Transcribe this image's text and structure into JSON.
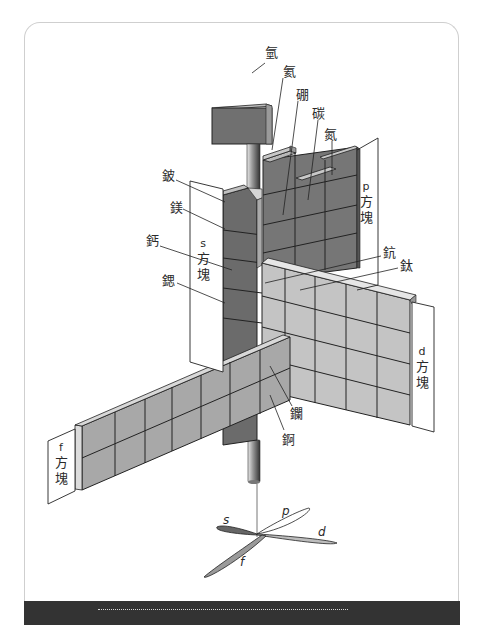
{
  "diagram": {
    "colors": {
      "s_block": "#6b6b6b",
      "p_block": "#767676",
      "d_block": "#c4c4c4",
      "f_block": "#a8a8a8",
      "hydrogen": "#707070",
      "rod": "#8a8a8a",
      "footer": "#333333",
      "card_border": "#cfcfcf"
    },
    "element_labels": {
      "hydrogen": "氫",
      "helium": "氦",
      "boron": "硼",
      "carbon": "碳",
      "nitrogen": "氮",
      "beryllium": "鈹",
      "magnesium": "鎂",
      "calcium": "鈣",
      "strontium": "鍶",
      "scandium": "鈧",
      "titanium": "鈦",
      "lanthanum": "鑭",
      "actinium": "錒"
    },
    "block_labels": {
      "s": {
        "letter": "s",
        "word1": "方",
        "word2": "塊"
      },
      "p": {
        "letter": "p",
        "word1": "方",
        "word2": "塊"
      },
      "d": {
        "letter": "d",
        "word1": "方",
        "word2": "塊"
      },
      "f": {
        "letter": "f",
        "word1": "方",
        "word2": "塊"
      }
    },
    "orbitals": {
      "s": "s",
      "p": "p",
      "d": "d",
      "f": "f"
    }
  }
}
